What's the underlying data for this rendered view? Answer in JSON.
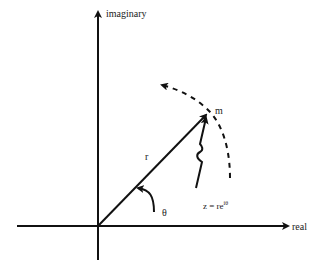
{
  "diagram": {
    "type": "complex-plane-polar",
    "colors": {
      "ink": "#111111",
      "background": "#ffffff"
    },
    "axes": {
      "x_label": "real",
      "y_label": "imaginary",
      "origin": [
        98,
        226
      ]
    },
    "labels": {
      "radius": "r",
      "angle": "θ",
      "point": "m",
      "equation_base": "z = re",
      "equation_exponent": "iθ"
    },
    "vector": {
      "from": [
        98,
        226
      ],
      "to": [
        208,
        114
      ]
    },
    "arc": {
      "style": "dashed",
      "direction": "counter-clockwise"
    }
  }
}
